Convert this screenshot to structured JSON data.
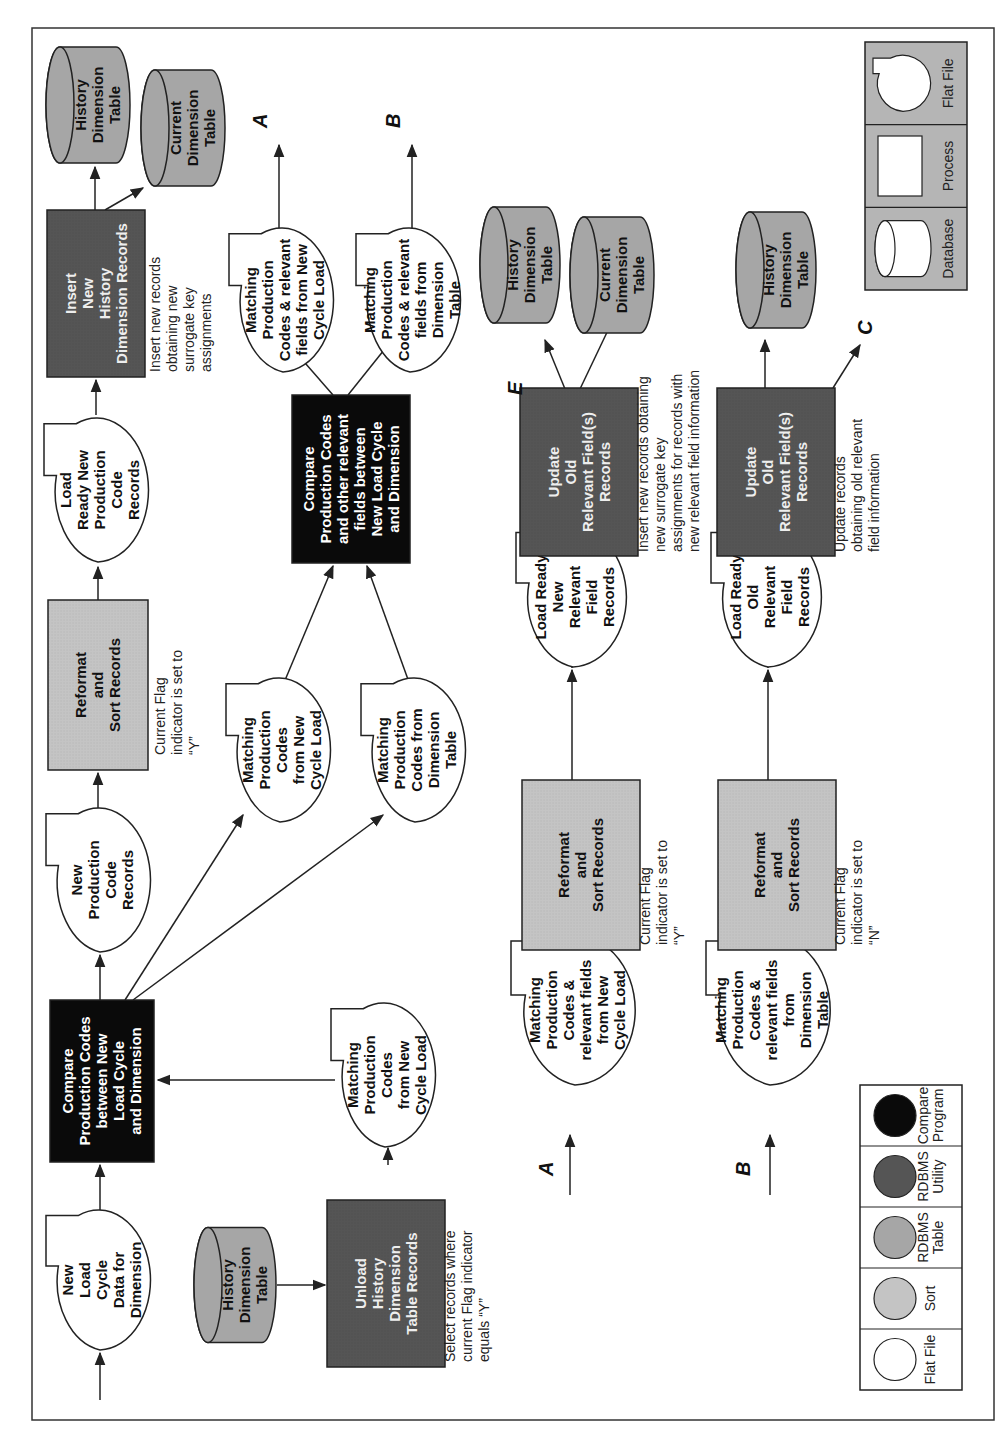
{
  "colors": {
    "flat_file": "#ffffff",
    "sort": "#c4c4c4",
    "rdbms_table": "#a6a6a6",
    "rdbms_utility": "#555555",
    "compare_program": "#0a0a0a",
    "stroke": "#222222",
    "legend_top_bg": "#b5b5b5"
  },
  "nodes": {
    "new_load_cycle": {
      "lines": [
        "New",
        "Load",
        "Cycle",
        "Data for",
        "Dimension"
      ]
    },
    "compare1": {
      "lines": [
        "Compare",
        "Production Codes",
        "between New",
        "Load Cycle",
        "and Dimension"
      ]
    },
    "history_db_1": {
      "lines": [
        "History",
        "Dimension",
        "Table"
      ]
    },
    "unload_history": {
      "lines": [
        "Unload",
        "History",
        "Dimension",
        "Table Records"
      ]
    },
    "unload_note": {
      "lines": [
        "Select records where",
        "current Flag indicator",
        "equals “Y”"
      ]
    },
    "matching_new_1": {
      "lines": [
        "Matching",
        "Production",
        "Codes",
        "from New",
        "Cycle Load"
      ]
    },
    "new_prod_code": {
      "lines": [
        "New",
        "Production",
        "Code",
        "Records"
      ]
    },
    "reformat1": {
      "lines": [
        "Reformat",
        "and",
        "Sort Records"
      ]
    },
    "reformat1_note": {
      "lines": [
        "Current Flag",
        "indicator is set to",
        "“Y”"
      ]
    },
    "load_ready_new": {
      "lines": [
        "Load",
        "Ready New",
        "Production",
        "Code",
        "Records"
      ]
    },
    "insert_history": {
      "lines": [
        "Insert",
        "New",
        "History",
        "Dimension Records"
      ]
    },
    "insert_note": {
      "lines": [
        "Insert new  records",
        "obtaining new",
        "surrogate key",
        "assignments"
      ]
    },
    "history_db_2": {
      "lines": [
        "History",
        "Dimension",
        "Table"
      ]
    },
    "current_db_1": {
      "lines": [
        "Current",
        "Dimension",
        "Table"
      ]
    },
    "matching_new_2": {
      "lines": [
        "Matching",
        "Production",
        "Codes",
        "from New",
        "Cycle Load"
      ]
    },
    "matching_dim_1": {
      "lines": [
        "Matching",
        "Production",
        "Codes from",
        "Dimension",
        "Table"
      ]
    },
    "compare2": {
      "lines": [
        "Compare",
        "Production Codes",
        "and other relevant",
        "fields between",
        "New Load Cycle",
        "and Dimension"
      ]
    },
    "out_a": {
      "lines": [
        "Matching",
        "Production",
        "Codes & relevant",
        "fields from New",
        "Cycle Load"
      ]
    },
    "out_b": {
      "lines": [
        "Matching",
        "Production",
        "Codes & relevant",
        "fields from",
        "Dimension",
        "Table"
      ]
    },
    "in_a": {
      "lines": [
        "Matching",
        "Production",
        "Codes &",
        "relevant fields",
        "from New",
        "Cycle Load"
      ]
    },
    "reformat_a": {
      "lines": [
        "Reformat",
        "and",
        "Sort Records"
      ]
    },
    "reformat_a_note": {
      "lines": [
        "Current Flag",
        "indicator is set to",
        "“Y”"
      ]
    },
    "load_ready_new_rel": {
      "lines": [
        "Load Ready",
        "New",
        "Relevant",
        "Field",
        "Records"
      ]
    },
    "update_new": {
      "lines": [
        "Update",
        "Old",
        "Relevant Field(s)",
        "Records"
      ]
    },
    "update_new_note": {
      "lines": [
        "Insert new records obtaining",
        "new surrogate key",
        "assignments for records with",
        "new relevant field information"
      ]
    },
    "history_db_3": {
      "lines": [
        "History",
        "Dimension",
        "Table"
      ]
    },
    "current_db_2": {
      "lines": [
        "Current",
        "Dimension",
        "Table"
      ]
    },
    "in_b": {
      "lines": [
        "Matching",
        "Production",
        "Codes &",
        "relevant fields",
        "from",
        "Dimension",
        "Table"
      ]
    },
    "reformat_b": {
      "lines": [
        "Reformat",
        "and",
        "Sort Records"
      ]
    },
    "reformat_b_note": {
      "lines": [
        "Current Flag",
        "indicator is set to",
        "“N”"
      ]
    },
    "load_ready_old_rel": {
      "lines": [
        "Load Ready",
        "Old",
        "Relevant",
        "Field",
        "Records"
      ]
    },
    "update_old": {
      "lines": [
        "Update",
        "Old",
        "Relevant Field(s)",
        "Records"
      ]
    },
    "update_old_note": {
      "lines": [
        "Update records",
        "obtaining old relevant",
        "field information"
      ]
    },
    "history_db_4": {
      "lines": [
        "History",
        "Dimension",
        "Table"
      ]
    }
  },
  "connectors": {
    "A": "A",
    "B": "B",
    "C": "C",
    "E": "E"
  },
  "legend_colors": [
    {
      "label_lines": [
        "Flat File"
      ],
      "color": "#ffffff"
    },
    {
      "label_lines": [
        "Sort"
      ],
      "color": "#c4c4c4"
    },
    {
      "label_lines": [
        "RDBMS",
        "Table"
      ],
      "color": "#a6a6a6"
    },
    {
      "label_lines": [
        "RDBMS",
        "Utility"
      ],
      "color": "#555555"
    },
    {
      "label_lines": [
        "Compare",
        "Program"
      ],
      "color": "#0a0a0a"
    }
  ],
  "legend_shapes": [
    {
      "label": "Database",
      "shape": "cylinder"
    },
    {
      "label": "Process",
      "shape": "rectangle"
    },
    {
      "label": "Flat File",
      "shape": "flat-file"
    }
  ]
}
